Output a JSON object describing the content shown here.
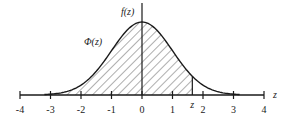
{
  "diagram": {
    "curve_label": "f(z)",
    "area_label": "Φ(z)",
    "axis_label": "z",
    "z_marker_label": "z",
    "x_range": [
      -4,
      4
    ],
    "ticks": [
      -4,
      -3,
      -2,
      -1,
      0,
      1,
      2,
      3,
      4
    ],
    "tick_labels": [
      "-4",
      "-3",
      "-2",
      "-1",
      "0",
      "1",
      "2",
      "3",
      "4"
    ],
    "shaded_upper_z": 1.65,
    "colors": {
      "line": "#1a1a1a",
      "hatch": "#333333",
      "background": "#ffffff"
    }
  }
}
